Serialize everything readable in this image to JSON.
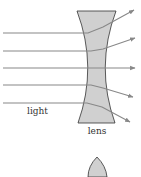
{
  "diagram": {
    "labels": {
      "light": "light",
      "lens": "lens"
    },
    "colors": {
      "background": "#ffffff",
      "lens_fill": "#d0d0d0",
      "lens_stroke": "#333333",
      "ray": "#888888",
      "label": "#333333"
    },
    "lens_shape": "concave",
    "second_shape": "convex-lens-partial",
    "rays": [
      {
        "y_in": 33,
        "x_out_tip": 134,
        "y_out_tip": 10
      },
      {
        "y_in": 51,
        "x_out_tip": 135,
        "y_out_tip": 38
      },
      {
        "y_in": 68,
        "x_out_tip": 135,
        "y_out_tip": 68
      },
      {
        "y_in": 85,
        "x_out_tip": 133,
        "y_out_tip": 97
      },
      {
        "y_in": 103,
        "x_out_tip": 130,
        "y_out_tip": 122
      }
    ]
  }
}
